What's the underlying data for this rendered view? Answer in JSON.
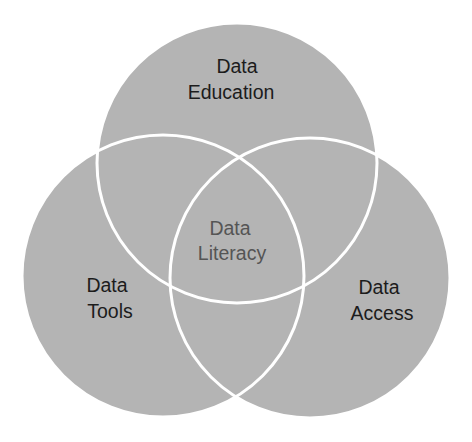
{
  "diagram": {
    "type": "venn",
    "fill_color": "#b4b4b4",
    "outline_color": "#ffffff",
    "sets": [
      {
        "id": "education",
        "label_lines": [
          "Data",
          "Education"
        ]
      },
      {
        "id": "tools",
        "label_lines": [
          "Data",
          "Tools"
        ]
      },
      {
        "id": "access",
        "label_lines": [
          "Data",
          "Access"
        ]
      }
    ],
    "intersection": {
      "label_lines": [
        "Data",
        "Literacy"
      ],
      "text_color": "#555555"
    },
    "label_color": "#1c1c1c"
  }
}
